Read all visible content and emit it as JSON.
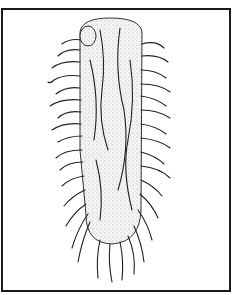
{
  "figure": {
    "style": "black-and-white stippled pen illustration",
    "border_color": "#1a1a1a",
    "ink_color": "#222222",
    "background": "#ffffff"
  }
}
